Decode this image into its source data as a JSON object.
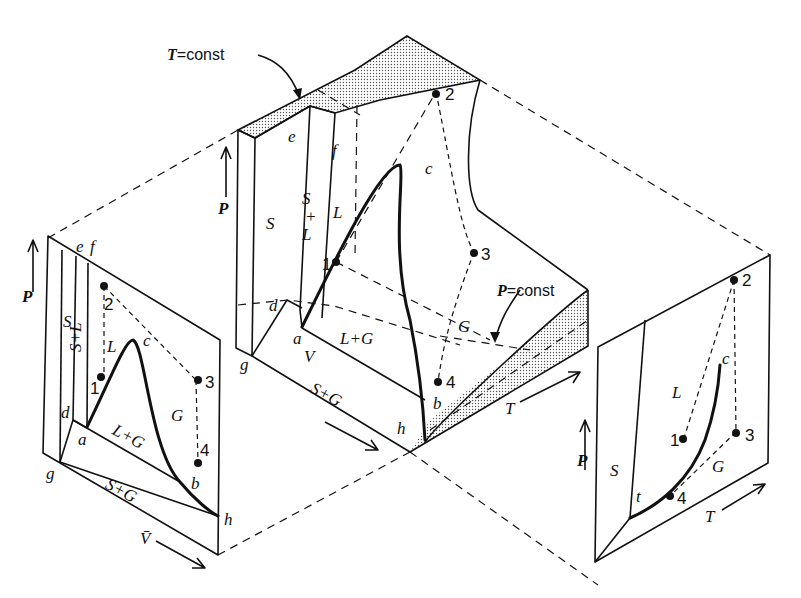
{
  "figure": {
    "type": "PVT phase diagram with P-V and P-T projections",
    "annotations": {
      "t_const_var": "T",
      "t_const_rest": "=const",
      "p_const_var": "P",
      "p_const_rest": "=const"
    },
    "center_surface": {
      "axes": {
        "p": "P",
        "v": "V",
        "t": "T"
      },
      "points": {
        "e": "e",
        "f": "f",
        "c": "c",
        "d": "d",
        "a": "a",
        "g": "g",
        "h": "h",
        "b": "b"
      },
      "regions": {
        "s": "S",
        "sl_s": "S",
        "sl_plus": "+",
        "sl_l": "L",
        "l": "L",
        "lg": "L+G",
        "sg": "S+G",
        "g": "G"
      },
      "states": [
        "1",
        "2",
        "3",
        "4"
      ]
    },
    "pv_projection": {
      "axes": {
        "p": "P",
        "v": "V̄"
      },
      "points": {
        "e": "e",
        "f": "f",
        "c": "c",
        "d": "d",
        "a": "a",
        "g": "g",
        "h": "h",
        "b": "b"
      },
      "regions": {
        "s": "S",
        "sl": "S+L",
        "l": "L",
        "lg": "L+G",
        "sg": "S+G",
        "g": "G"
      },
      "states": [
        "1",
        "2",
        "3",
        "4"
      ]
    },
    "pt_projection": {
      "axes": {
        "p": "P",
        "t": "T"
      },
      "points": {
        "c": "c",
        "t": "t"
      },
      "regions": {
        "s": "S",
        "l": "L",
        "g": "G"
      },
      "states": [
        "1",
        "2",
        "3",
        "4"
      ]
    }
  }
}
